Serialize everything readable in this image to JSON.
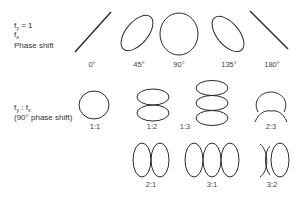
{
  "row1": {
    "label": {
      "numerator": "f",
      "numerator_sub": "y",
      "equals": "= 1",
      "denominator": "f",
      "denominator_sub": "x",
      "line2": "Phase shift"
    },
    "captions": [
      "0°",
      "45°",
      "90°",
      "135°",
      "180°"
    ]
  },
  "row2": {
    "label": {
      "ratio_f1": "f",
      "ratio_sub1": "y",
      "ratio_sep": " : ",
      "ratio_f2": "f",
      "ratio_sub2": "x",
      "line2": "(90° phase shift)"
    },
    "captions_top": [
      "1:1",
      "1:2",
      "1:3",
      "2:3"
    ],
    "captions_bottom": [
      "2:1",
      "3:1",
      "3:2"
    ]
  },
  "stroke_color": "#2a2a2a"
}
